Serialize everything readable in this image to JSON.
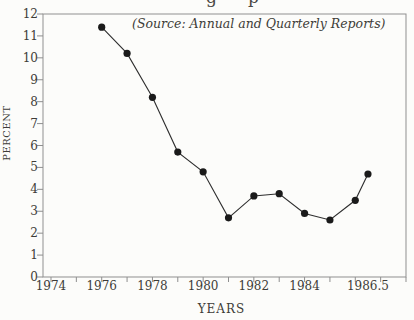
{
  "figure": {
    "cropped_title_fragments": [
      "g",
      "p"
    ],
    "source_note": "(Source: Annual and Quarterly Reports)"
  },
  "chart_data": {
    "type": "line",
    "title": "",
    "source_note": "(Source: Annual and Quarterly Reports)",
    "xlabel": "YEARS",
    "ylabel": "PERCENT",
    "x": [
      1976,
      1977,
      1978,
      1979,
      1980,
      1981,
      1982,
      1983,
      1984,
      1985,
      1986,
      1986.5
    ],
    "y": [
      11.4,
      10.2,
      8.2,
      5.7,
      4.8,
      2.7,
      3.7,
      3.8,
      2.9,
      2.6,
      3.5,
      4.7
    ],
    "series_name": "percent",
    "xlim": [
      1974,
      1988
    ],
    "ylim": [
      0,
      12
    ],
    "x_tick_step": 1,
    "y_tick_step": 1,
    "x_tick_labels": [
      {
        "x": 1974,
        "label": "1974"
      },
      {
        "x": 1976,
        "label": "1976"
      },
      {
        "x": 1978,
        "label": "1978"
      },
      {
        "x": 1980,
        "label": "1980"
      },
      {
        "x": 1982,
        "label": "1982"
      },
      {
        "x": 1984,
        "label": "1984"
      },
      {
        "x": 1986.5,
        "label": "1986.5"
      }
    ],
    "y_tick_labels": [
      "0",
      "1",
      "2",
      "3",
      "4",
      "5",
      "6",
      "7",
      "8",
      "9",
      "10",
      "11",
      "12"
    ],
    "grid": false,
    "legend": "none",
    "marker": "filled-circle",
    "colors": {
      "background": "#fcfcfa",
      "frame": "#8f8f8f",
      "tick": "#8f8f8f",
      "line": "#2e2e2e",
      "marker": "#1a1a1a",
      "text": "#3e3c38"
    }
  }
}
